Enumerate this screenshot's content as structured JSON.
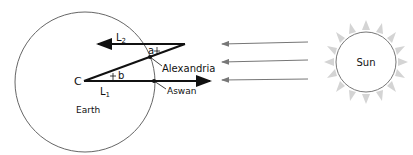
{
  "diagram": {
    "title_clipped": "…",
    "labels": {
      "l2": "L",
      "l2_sub": "2",
      "l1": "L",
      "l1_sub": "1",
      "angle_a": "a",
      "angle_b": "b",
      "center": "C",
      "alexandria": "Alexandria",
      "aswan": "Aswan",
      "earth": "Earth",
      "sun": "Sun"
    },
    "colors": {
      "line": "#111111",
      "circle": "#666666",
      "rays": "#777777",
      "sun_glow": "#cccccc"
    }
  }
}
